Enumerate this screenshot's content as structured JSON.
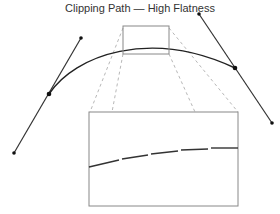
{
  "title": "Clipping Path — High Flatness",
  "colors": {
    "curve": "#222222",
    "tangent": "#333333",
    "zoom_box": "#888888",
    "guide": "#b8b8b8"
  },
  "diagram": {
    "curve": {
      "start": [
        49,
        94
      ],
      "c1": [
        100,
        35
      ],
      "c2": [
        200,
        25
      ],
      "end": [
        235,
        68
      ]
    },
    "left_handle": {
      "control": [
        81,
        38
      ],
      "anchor": [
        49,
        94
      ],
      "end": [
        14,
        153
      ]
    },
    "right_handle": {
      "control": [
        199,
        14
      ],
      "anchor": [
        235,
        68
      ],
      "end": [
        272,
        123
      ]
    },
    "zoom_source_rect": {
      "x": 123,
      "y": 26,
      "w": 46,
      "h": 28
    },
    "zoom_target_rect": {
      "x": 89,
      "y": 112,
      "w": 149,
      "h": 94
    },
    "flattened_segments": [
      [
        89,
        167
      ],
      [
        120,
        160
      ],
      [
        150,
        154
      ],
      [
        180,
        150
      ],
      [
        210,
        148
      ],
      [
        238,
        148
      ]
    ]
  }
}
